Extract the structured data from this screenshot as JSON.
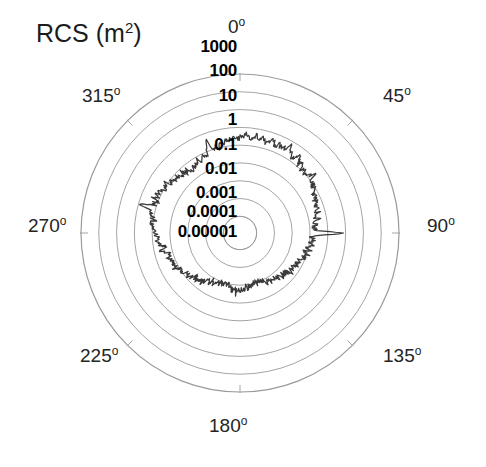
{
  "figure": {
    "axis_title_text": "RCS (m",
    "axis_title_unit_exp": "2",
    "axis_title_close": ")",
    "background_color": "#ffffff",
    "grid_color": "#9a9a9a",
    "trace_color": "#3a3a3a"
  },
  "angle_labels": [
    {
      "name": "angle-0",
      "text": "0",
      "deg_glyph": "o",
      "value": 0,
      "x": 228,
      "y": 16
    },
    {
      "name": "angle-45",
      "text": "45",
      "deg_glyph": "o",
      "value": 45,
      "x": 383,
      "y": 85
    },
    {
      "name": "angle-90",
      "text": "90",
      "deg_glyph": "o",
      "value": 90,
      "x": 427,
      "y": 215
    },
    {
      "name": "angle-135",
      "text": "135",
      "deg_glyph": "o",
      "value": 135,
      "x": 383,
      "y": 345
    },
    {
      "name": "angle-180",
      "text": "180",
      "deg_glyph": "o",
      "value": 180,
      "x": 209,
      "y": 415
    },
    {
      "name": "angle-225",
      "text": "225",
      "deg_glyph": "o",
      "value": 225,
      "x": 80,
      "y": 345
    },
    {
      "name": "angle-270",
      "text": "270",
      "deg_glyph": "o",
      "value": 270,
      "x": 28,
      "y": 215
    },
    {
      "name": "angle-315",
      "text": "315",
      "deg_glyph": "o",
      "value": 315,
      "x": 82,
      "y": 85
    }
  ],
  "radial_labels": [
    {
      "name": "radial-1000",
      "text": "1000",
      "value": 1000,
      "x": 237,
      "y": 47
    },
    {
      "name": "radial-100",
      "text": "100",
      "value": 100,
      "x": 237,
      "y": 71
    },
    {
      "name": "radial-10",
      "text": "10",
      "value": 10,
      "x": 237,
      "y": 96
    },
    {
      "name": "radial-1",
      "text": "1",
      "value": 1,
      "x": 237,
      "y": 120
    },
    {
      "name": "radial-0.1",
      "text": "0.1",
      "value": 0.1,
      "x": 237,
      "y": 145
    },
    {
      "name": "radial-0.01",
      "text": "0.01",
      "value": 0.01,
      "x": 237,
      "y": 169
    },
    {
      "name": "radial-0.001",
      "text": "0.001",
      "value": 0.001,
      "x": 237,
      "y": 193
    },
    {
      "name": "radial-0.0001",
      "text": "0.0001",
      "value": 0.0001,
      "x": 237,
      "y": 212
    },
    {
      "name": "radial-0.00001",
      "text": "0.00001",
      "value": 1e-05,
      "x": 237,
      "y": 232
    }
  ],
  "chart_data": {
    "type": "line",
    "subtype": "polar",
    "title": "RCS (m2)",
    "xlabel": "Azimuth angle (degrees)",
    "ylabel": "RCS (m^2)",
    "r_scale": "log",
    "rlim": [
      1e-05,
      1000
    ],
    "r_ticks": [
      1e-05,
      0.0001,
      0.001,
      0.01,
      0.1,
      1,
      10,
      100,
      1000
    ],
    "r_tick_labels": [
      "0.00001",
      "0.0001",
      "0.001",
      "0.01",
      "0.1",
      "1",
      "10",
      "100",
      "1000"
    ],
    "theta_ticks": [
      0,
      45,
      90,
      135,
      180,
      225,
      270,
      315
    ],
    "theta_tick_labels": [
      "0o",
      "45o",
      "90o",
      "135o",
      "180o",
      "225o",
      "270o",
      "315o"
    ],
    "theta_zero_location": "N",
    "theta_direction": "clockwise",
    "grid": true,
    "legend": null,
    "series": [
      {
        "name": "RCS",
        "color": "#3a3a3a",
        "description": "Monostatic radar cross section versus azimuth; noisy spiky trace with broad lobes near 0/180 deg and sharp specular spikes near 90 and 270 deg.",
        "theta_deg": [
          0,
          2,
          4,
          6,
          8,
          10,
          12,
          14,
          16,
          18,
          20,
          22,
          24,
          26,
          28,
          30,
          32,
          34,
          36,
          38,
          40,
          42,
          44,
          46,
          48,
          50,
          52,
          54,
          56,
          58,
          60,
          62,
          64,
          66,
          68,
          70,
          72,
          74,
          76,
          78,
          80,
          82,
          84,
          86,
          88,
          90,
          92,
          94,
          96,
          98,
          100,
          102,
          104,
          106,
          108,
          110,
          112,
          114,
          116,
          118,
          120,
          122,
          124,
          126,
          128,
          130,
          132,
          134,
          136,
          138,
          140,
          142,
          144,
          146,
          148,
          150,
          152,
          154,
          156,
          158,
          160,
          162,
          164,
          166,
          168,
          170,
          172,
          174,
          176,
          178,
          180,
          182,
          184,
          186,
          188,
          190,
          192,
          194,
          196,
          198,
          200,
          202,
          204,
          206,
          208,
          210,
          212,
          214,
          216,
          218,
          220,
          222,
          224,
          226,
          228,
          230,
          232,
          234,
          236,
          238,
          240,
          242,
          244,
          246,
          248,
          250,
          252,
          254,
          256,
          258,
          260,
          262,
          264,
          266,
          268,
          270,
          272,
          274,
          276,
          278,
          280,
          282,
          284,
          286,
          288,
          290,
          292,
          294,
          296,
          298,
          300,
          302,
          304,
          306,
          308,
          310,
          312,
          314,
          316,
          318,
          320,
          322,
          324,
          326,
          328,
          330,
          332,
          334,
          336,
          338,
          340,
          342,
          344,
          346,
          348,
          350,
          352,
          354,
          356,
          358
        ],
        "r_values": [
          0.35,
          0.28,
          0.42,
          0.22,
          0.31,
          0.5,
          0.26,
          0.38,
          0.21,
          0.33,
          0.45,
          0.24,
          0.36,
          0.19,
          0.29,
          0.6,
          0.27,
          0.16,
          0.23,
          0.34,
          0.14,
          0.2,
          0.11,
          0.17,
          0.09,
          0.13,
          0.22,
          0.08,
          0.12,
          0.07,
          0.1,
          0.055,
          0.08,
          0.045,
          0.065,
          0.035,
          0.05,
          0.028,
          0.04,
          0.022,
          0.03,
          0.018,
          0.025,
          0.015,
          0.02,
          0.9,
          0.02,
          0.013,
          0.018,
          0.011,
          0.015,
          0.009,
          0.012,
          0.0075,
          0.01,
          0.0062,
          0.0085,
          0.005,
          0.007,
          0.0042,
          0.006,
          0.0035,
          0.005,
          0.003,
          0.0042,
          0.0026,
          0.0035,
          0.0022,
          0.003,
          0.0019,
          0.0026,
          0.0016,
          0.0022,
          0.0014,
          0.0019,
          0.0012,
          0.0016,
          0.001,
          0.0014,
          0.0009,
          0.0012,
          0.0008,
          0.0011,
          0.0009,
          0.0013,
          0.0011,
          0.0016,
          0.0014,
          0.002,
          0.0018,
          0.0025,
          0.0022,
          0.0028,
          0.0022,
          0.0018,
          0.0014,
          0.0011,
          0.0013,
          0.0009,
          0.0012,
          0.001,
          0.0014,
          0.0012,
          0.0016,
          0.0019,
          0.0014,
          0.0022,
          0.0018,
          0.0026,
          0.0035,
          0.003,
          0.0042,
          0.005,
          0.0038,
          0.006,
          0.007,
          0.005,
          0.0085,
          0.01,
          0.0075,
          0.012,
          0.015,
          0.011,
          0.018,
          0.013,
          0.022,
          0.02,
          0.015,
          0.028,
          0.035,
          0.025,
          0.045,
          0.055,
          0.04,
          0.065,
          0.08,
          0.06,
          0.1,
          0.12,
          0.09,
          0.15,
          0.2,
          0.14,
          0.85,
          0.16,
          0.11,
          0.18,
          0.13,
          0.2,
          0.15,
          0.1,
          0.08,
          0.12,
          0.07,
          0.09,
          0.055,
          0.075,
          0.045,
          0.06,
          0.035,
          0.05,
          0.03,
          0.04,
          0.028,
          0.05,
          0.065,
          0.045,
          0.08,
          0.06,
          0.1,
          0.5,
          0.09,
          0.13,
          0.1,
          0.17,
          0.14,
          0.22,
          0.18,
          0.28,
          0.2,
          0.3,
          0.24,
          0.38,
          0.3,
          0.45,
          0.35,
          0.25,
          0.4,
          0.3,
          0.5,
          0.38,
          0.28,
          0.45
        ],
        "noise_band_db": 6
      }
    ],
    "annotations": []
  }
}
